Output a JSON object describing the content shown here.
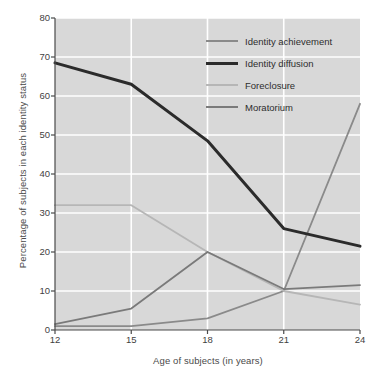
{
  "chart_data": {
    "type": "line",
    "title": "",
    "xlabel": "Age of subjects (in years)",
    "ylabel": "Percentage of subjects in each identity status",
    "x": [
      12,
      15,
      18,
      21,
      24
    ],
    "xticklabels": [
      "12",
      "15",
      "18",
      "21",
      "24"
    ],
    "yticklabels": [
      "0",
      "10",
      "20",
      "30",
      "40",
      "50",
      "60",
      "70",
      "80"
    ],
    "xlim": [
      12,
      24
    ],
    "ylim": [
      0,
      80
    ],
    "grid": true,
    "legend_position": "upper right",
    "plot_background": "#d8d8d8",
    "gridline_color": "#ffffff",
    "series": [
      {
        "name": "Identity achievement",
        "color": "#8a8a8a",
        "width": 1.8,
        "values": [
          1,
          1,
          3,
          10,
          58
        ]
      },
      {
        "name": "Identity diffusion",
        "color": "#2b2b2b",
        "width": 3.0,
        "values": [
          68.5,
          63,
          48.5,
          26,
          21.5
        ]
      },
      {
        "name": "Foreclosure",
        "color": "#b6b6b6",
        "width": 1.8,
        "values": [
          32,
          32,
          20,
          10,
          6.5
        ]
      },
      {
        "name": "Moratorium",
        "color": "#7a7a7a",
        "width": 1.8,
        "values": [
          1.5,
          5.5,
          20,
          10.5,
          11.5
        ]
      }
    ]
  }
}
